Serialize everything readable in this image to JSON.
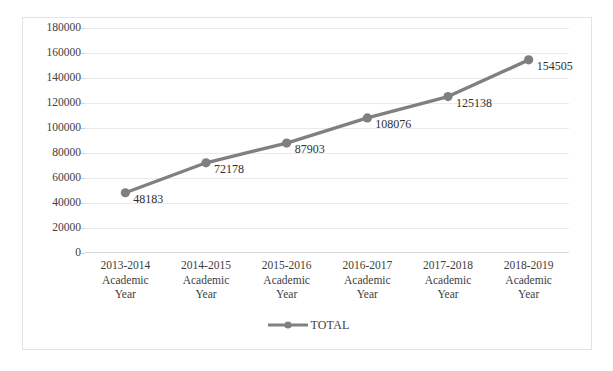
{
  "top_caption": {
    "text": "",
    "visible": false
  },
  "legend": {
    "position": "bottom-center",
    "entries": [
      {
        "label": "TOTAL",
        "color": "#808080",
        "marker": "circle"
      }
    ]
  },
  "colors": {
    "series": "#808080",
    "marker": "#7f7f7f",
    "gridline": "#eaeaea",
    "frame": "#e3e3e3",
    "axis": "#d9d9d9",
    "text": "#3d3d3d",
    "label_text": "#2f2f2f",
    "background": "#ffffff"
  },
  "chart_data": {
    "type": "line",
    "title": "",
    "xlabel": "",
    "ylabel": "",
    "categories": [
      "2013-2014 Academic Year",
      "2014-2015 Academic Year",
      "2015-2016 Academic Year",
      "2016-2017 Academic Year",
      "2017-2018 Academic Year",
      "2018-2019 Academic Year"
    ],
    "category_lines": [
      [
        "2013-2014",
        "Academic",
        "Year"
      ],
      [
        "2014-2015",
        "Academic",
        "Year"
      ],
      [
        "2015-2016",
        "Academic",
        "Year"
      ],
      [
        "2016-2017",
        "Academic",
        "Year"
      ],
      [
        "2017-2018",
        "Academic",
        "Year"
      ],
      [
        "2018-2019",
        "Academic",
        "Year"
      ]
    ],
    "series": [
      {
        "name": "TOTAL",
        "values": [
          48183,
          72178,
          87903,
          108076,
          125138,
          154505
        ],
        "data_labels": [
          "48183",
          "72178",
          "87903",
          "108076",
          "125138",
          "154505"
        ],
        "color": "#808080",
        "marker": "circle",
        "show_data_labels": true
      }
    ],
    "ylim": [
      0,
      180000
    ],
    "ytick_step": 20000,
    "yticks": [
      0,
      20000,
      40000,
      60000,
      80000,
      100000,
      120000,
      140000,
      160000,
      180000
    ],
    "ytick_labels": [
      "0",
      "20000",
      "40000",
      "60000",
      "80000",
      "100000",
      "120000",
      "140000",
      "160000",
      "180000"
    ],
    "grid": {
      "horizontal": true,
      "vertical": false
    },
    "legend_position": "bottom"
  }
}
